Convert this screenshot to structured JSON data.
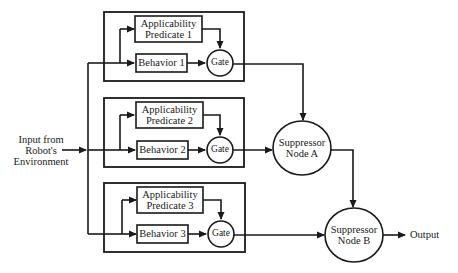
{
  "diagram": {
    "type": "subsumption-architecture-block-diagram",
    "input": {
      "lines": [
        "Input from",
        "Robot's",
        "Environment"
      ]
    },
    "modules": [
      {
        "applicability_lines": [
          "Applicability",
          "Predicate 1"
        ],
        "behavior": "Behavior 1",
        "gate": "Gate"
      },
      {
        "applicability_lines": [
          "Applicability",
          "Predicate 2"
        ],
        "behavior": "Behavior 2",
        "gate": "Gate"
      },
      {
        "applicability_lines": [
          "Applicability",
          "Predicate 3"
        ],
        "behavior": "Behavior 3",
        "gate": "Gate"
      }
    ],
    "suppressors": [
      {
        "lines": [
          "Suppressor",
          "Node A"
        ]
      },
      {
        "lines": [
          "Suppressor",
          "Node B"
        ]
      }
    ],
    "output": "Output",
    "colors": {
      "line": "#1a1a1a",
      "background": "#ffffff"
    }
  }
}
